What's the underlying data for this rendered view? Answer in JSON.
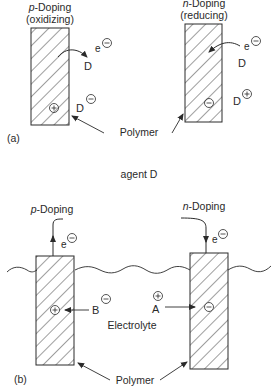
{
  "panel_a": {
    "tag": "(a)",
    "left": {
      "title_italic": "p",
      "title_rest": "-Doping",
      "subtitle": "(oxidizing)",
      "electron": "e",
      "dopant_top": "D",
      "dopant_bottom": "D",
      "polymer_charge": "+",
      "dopant_charge": "−"
    },
    "right": {
      "title_italic": "n",
      "title_rest": "-Doping",
      "subtitle": "(reducing)",
      "electron": "e",
      "dopant_top": "D",
      "dopant_bottom": "D",
      "polymer_charge": "−",
      "dopant_charge": "+"
    },
    "polymer_label": "Polymer"
  },
  "caption_middle": "agent D",
  "panel_b": {
    "tag": "(b)",
    "left": {
      "title_italic": "p",
      "title_rest": "-Doping",
      "electron": "e",
      "ion": "B",
      "polymer_charge": "+",
      "ion_charge": "−"
    },
    "right": {
      "title_italic": "n",
      "title_rest": "-Doping",
      "electron": "e",
      "ion": "A",
      "polymer_charge": "−",
      "ion_charge": "+"
    },
    "electrolyte_label": "Electrolyte",
    "polymer_label": "Polymer"
  },
  "colors": {
    "ink": "#2a2a2a",
    "background": "#ffffff"
  }
}
